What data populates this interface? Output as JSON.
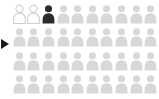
{
  "figure": {
    "type": "pictogram",
    "icon_name": "person-icon",
    "rows": 4,
    "columns": 10,
    "total_icons": 40,
    "pointer_marker_label": "left-pointer-marker"
  },
  "colors": {
    "background": "#ffffff",
    "icon_default": "#d8d8d8",
    "icon_outline_fill": "#ffffff",
    "icon_outline_stroke": "#cfcfcf",
    "icon_highlight": "#2b2b2b",
    "pointer_marker": "#1a1a1a"
  },
  "chart_data": {
    "type": "bar",
    "title": "",
    "subtitle": "",
    "xlabel": "",
    "ylabel": "",
    "categories": [
      "Outlined",
      "Highlighted",
      "Default"
    ],
    "values": [
      2,
      1,
      37
    ],
    "series": [
      {
        "name": "Icon states",
        "values": [
          2,
          1,
          37
        ]
      }
    ],
    "unit_value": 1,
    "total": 40,
    "grid": false,
    "legend": "none",
    "annotations": [],
    "icon_states": [
      "outline",
      "outline",
      "highlight",
      "default",
      "default",
      "default",
      "default",
      "default",
      "default",
      "default",
      "default",
      "default",
      "default",
      "default",
      "default",
      "default",
      "default",
      "default",
      "default",
      "default",
      "default",
      "default",
      "default",
      "default",
      "default",
      "default",
      "default",
      "default",
      "default",
      "default",
      "default",
      "default",
      "default",
      "default",
      "default",
      "default",
      "default",
      "default",
      "default",
      "default"
    ]
  }
}
